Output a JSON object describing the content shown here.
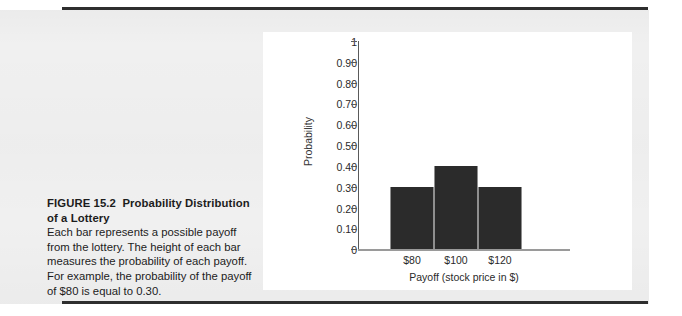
{
  "figure": {
    "number_label": "FIGURE 15.2",
    "title": "Probability Distribution of a Lottery",
    "body": "Each bar represents a possible payoff from the lottery. The height of each bar measures the probability of each payoff. For example, the probability of the payoff of $80 is equal to 0.30."
  },
  "colors": {
    "bar_fill": "#2b2b2b",
    "page_background": "#f0f0f0",
    "panel_background": "#ffffff",
    "rule": "#2e2e2e",
    "axis": "#5a5a5a"
  },
  "chart_data": {
    "type": "bar",
    "title": "",
    "categories": [
      "$80",
      "$100",
      "$120"
    ],
    "values": [
      0.3,
      0.4,
      0.3
    ],
    "xlabel": "Payoff (stock price in $)",
    "ylabel": "Probability",
    "ylim": [
      0,
      1
    ],
    "yticks": [
      0,
      0.1,
      0.2,
      0.3,
      0.4,
      0.5,
      0.6,
      0.7,
      0.8,
      0.9,
      1
    ],
    "ytick_labels": [
      "0",
      "0.10",
      "0.20",
      "0.30",
      "0.40",
      "0.50",
      "0.60",
      "0.70",
      "0.80",
      "0.90",
      "1"
    ],
    "grid": false,
    "legend": false,
    "bar_gap": 0
  }
}
